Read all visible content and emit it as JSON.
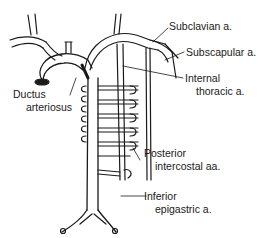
{
  "diagram": {
    "type": "anatomical-illustration",
    "labels": {
      "subclavian": "Subclavian a.",
      "subscapular": "Subscapular a.",
      "internal_thoracic_1": "Internal",
      "internal_thoracic_2": "thoracic a.",
      "ductus_1": "Ductus",
      "ductus_2": "arteriosus",
      "posterior_1": "Posterior",
      "posterior_2": "intercostal aa.",
      "inferior_1": "Inferior",
      "inferior_2": "epigastric a."
    },
    "colors": {
      "line": "#1a1a1a",
      "background": "#ffffff"
    }
  }
}
